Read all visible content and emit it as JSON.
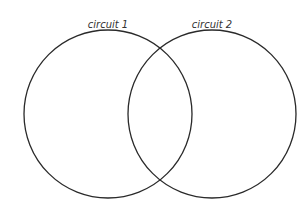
{
  "diagram": {
    "type": "venn",
    "stroke_color": "#2a2a2a",
    "background": "#ffffff",
    "sets": [
      {
        "label": "circuit 1",
        "cx": 108,
        "cy": 114,
        "r": 84,
        "label_x": 108,
        "label_y": 28
      },
      {
        "label": "circuit 2",
        "cx": 212,
        "cy": 114,
        "r": 84,
        "label_x": 212,
        "label_y": 28
      }
    ]
  }
}
